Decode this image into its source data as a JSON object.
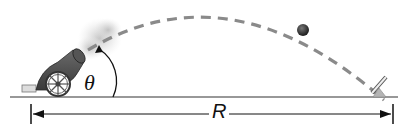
{
  "diagram": {
    "labels": {
      "angle": "θ",
      "range": "R"
    },
    "elements": {
      "cannon": "cannon on wheeled carriage with smoke",
      "trajectory": "dashed parabolic path",
      "projectile": "cannonball",
      "target": "target stand on ground"
    },
    "colors": {
      "trajectory": "#8a8a8a",
      "ground": "#333333",
      "cannon": "#4a4a4a",
      "smoke": "#cfcfcf",
      "ball": "#3a3a3a",
      "target_base": "#b5b5b5"
    }
  }
}
